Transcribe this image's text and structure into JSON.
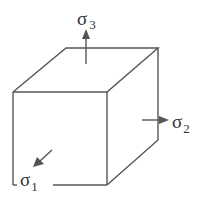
{
  "diagram": {
    "labels": {
      "sigma1": {
        "symbol": "σ",
        "subscript": "1"
      },
      "sigma2": {
        "symbol": "σ",
        "subscript": "2"
      },
      "sigma3": {
        "symbol": "σ",
        "subscript": "3"
      }
    },
    "colors": {
      "line": "#555555",
      "text": "#333333"
    }
  }
}
